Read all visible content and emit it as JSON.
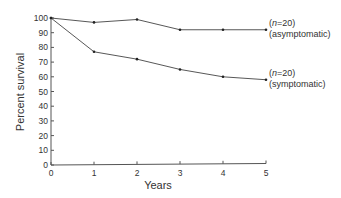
{
  "chart_data": {
    "type": "line",
    "title": "",
    "xlabel": "Years",
    "ylabel": "Percent survival",
    "x": [
      0,
      1,
      2,
      3,
      4,
      5
    ],
    "xlim": [
      0,
      5
    ],
    "ylim": [
      0,
      100
    ],
    "xticks": [
      "0",
      "1",
      "2",
      "3",
      "4",
      "5"
    ],
    "yticks": [
      "0",
      "10",
      "20",
      "30",
      "40",
      "50",
      "60",
      "70",
      "80",
      "90",
      "100"
    ],
    "grid": false,
    "legend": "none (inline end-of-line annotations)",
    "series": [
      {
        "name": "asymptomatic",
        "n_label": "(n=20)",
        "label": "(asymptomatic)",
        "values": [
          100,
          97,
          99,
          92,
          92,
          92
        ]
      },
      {
        "name": "symptomatic",
        "n_label": "(n=20)",
        "label": "(symptomatic)",
        "values": [
          100,
          77,
          72,
          65,
          60,
          58
        ]
      }
    ]
  },
  "annotations": {
    "asymptomatic": {
      "n_prefix": "(",
      "n_var": "n",
      "n_suffix": "=20)",
      "group": "(asymptomatic)"
    },
    "symptomatic": {
      "n_prefix": "(",
      "n_var": "n",
      "n_suffix": "=20)",
      "group": "(symptomatic)"
    }
  }
}
